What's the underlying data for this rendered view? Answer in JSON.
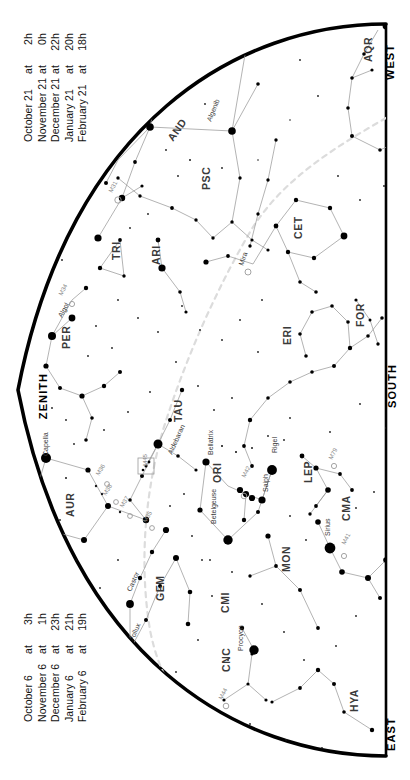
{
  "meta": {
    "orientation": "rotated-90",
    "background": "#ffffff",
    "ink": "#000000",
    "ecliptic_color": "#d8d8d8"
  },
  "cardinals": {
    "west": "WEST",
    "south": "SOUTH",
    "east": "EAST",
    "zenith": "ZENITH"
  },
  "legend_top": {
    "rows": [
      {
        "date": "October 21",
        "at": "at",
        "time": "2h"
      },
      {
        "date": "November 21",
        "at": "at",
        "time": "0h"
      },
      {
        "date": "December 21",
        "at": "at",
        "time": "22h"
      },
      {
        "date": "January 21",
        "at": "at",
        "time": "20h"
      },
      {
        "date": "February 21",
        "at": "at",
        "time": "18h"
      }
    ]
  },
  "legend_bottom": {
    "rows": [
      {
        "date": "October 6",
        "at": "at",
        "time": "3h"
      },
      {
        "date": "November 6",
        "at": "at",
        "time": "1h"
      },
      {
        "date": "December 6",
        "at": "at",
        "time": "23h"
      },
      {
        "date": "January 6",
        "at": "at",
        "time": "21h"
      },
      {
        "date": "February 6",
        "at": "at",
        "time": "19h"
      }
    ]
  },
  "chart_data": {
    "type": "scatter",
    "projection": "half-dome horizon map",
    "grid": false,
    "legend_position": "left",
    "constellations": [
      {
        "abbr": "AQR",
        "x": 372,
        "y": 62,
        "rot": -90
      },
      {
        "abbr": "PEG",
        "x": 205,
        "y": 76,
        "rot": -58
      },
      {
        "abbr": "AND",
        "x": 173,
        "y": 142,
        "rot": -55
      },
      {
        "abbr": "PSC",
        "x": 210,
        "y": 190,
        "rot": -90
      },
      {
        "abbr": "CET",
        "x": 302,
        "y": 239,
        "rot": -90
      },
      {
        "abbr": "TRI",
        "x": 120,
        "y": 260,
        "rot": -90
      },
      {
        "abbr": "ARI",
        "x": 160,
        "y": 265,
        "rot": -90
      },
      {
        "abbr": "PER",
        "x": 70,
        "y": 349,
        "rot": -90
      },
      {
        "abbr": "ERI",
        "x": 291,
        "y": 345,
        "rot": -90
      },
      {
        "abbr": "FOR",
        "x": 364,
        "y": 327,
        "rot": -90
      },
      {
        "abbr": "TAU",
        "x": 182,
        "y": 422,
        "rot": -90
      },
      {
        "abbr": "AUR",
        "x": 74,
        "y": 517,
        "rot": -90
      },
      {
        "abbr": "ORI",
        "x": 221,
        "y": 483,
        "rot": -90
      },
      {
        "abbr": "LEP",
        "x": 312,
        "y": 483,
        "rot": -90
      },
      {
        "abbr": "CMA",
        "x": 350,
        "y": 521,
        "rot": -90
      },
      {
        "abbr": "GEM",
        "x": 164,
        "y": 601,
        "rot": -90
      },
      {
        "abbr": "CMI",
        "x": 229,
        "y": 613,
        "rot": -90
      },
      {
        "abbr": "MON",
        "x": 290,
        "y": 572,
        "rot": -90
      },
      {
        "abbr": "CNC",
        "x": 230,
        "y": 672,
        "rot": -90
      },
      {
        "abbr": "HYA",
        "x": 358,
        "y": 712,
        "rot": -90
      }
    ],
    "named_stars": [
      {
        "name": "Algenib",
        "x": 211,
        "y": 122,
        "rot": -68,
        "mag": 2.8
      },
      {
        "name": "Alpheratz",
        "x": 150,
        "y": 117,
        "rot": -58,
        "mag": 2.1
      },
      {
        "name": "Mira",
        "x": 243,
        "y": 266,
        "rot": -70,
        "mag": 3.5
      },
      {
        "name": "Algol",
        "x": 62,
        "y": 318,
        "rot": -62,
        "mag": 2.1
      },
      {
        "name": "Capella",
        "x": 48,
        "y": 456,
        "rot": -90,
        "mag": 0.1
      },
      {
        "name": "Aldebaran",
        "x": 172,
        "y": 455,
        "rot": -66,
        "mag": 0.9
      },
      {
        "name": "Bellatrix",
        "x": 213,
        "y": 455,
        "rot": -90,
        "mag": 1.6
      },
      {
        "name": "Betelgeuse",
        "x": 216,
        "y": 524,
        "rot": -90,
        "mag": 0.5
      },
      {
        "name": "Rigel",
        "x": 277,
        "y": 453,
        "rot": -90,
        "mag": 0.1
      },
      {
        "name": "Saiph",
        "x": 268,
        "y": 492,
        "rot": -90,
        "mag": 2.1
      },
      {
        "name": "Sirius",
        "x": 330,
        "y": 536,
        "rot": -90,
        "mag": -1.5
      },
      {
        "name": "Castor",
        "x": 131,
        "y": 592,
        "rot": -66,
        "mag": 1.6
      },
      {
        "name": "Pollux",
        "x": 133,
        "y": 642,
        "rot": -66,
        "mag": 1.1
      },
      {
        "name": "Procyon",
        "x": 243,
        "y": 651,
        "rot": -90,
        "mag": 0.4
      }
    ],
    "deep_sky_objects": [
      {
        "name": "M31",
        "x": 112,
        "y": 193,
        "rot": -62
      },
      {
        "name": "M34",
        "x": 62,
        "y": 296,
        "rot": -62
      },
      {
        "name": "M36",
        "x": 99,
        "y": 476,
        "rot": -58
      },
      {
        "name": "M38",
        "x": 106,
        "y": 496,
        "rot": -58
      },
      {
        "name": "M37",
        "x": 123,
        "y": 508,
        "rot": -58
      },
      {
        "name": "M35",
        "x": 146,
        "y": 523,
        "rot": -58
      },
      {
        "name": "M45",
        "x": 147,
        "y": 466,
        "rot": -90
      },
      {
        "name": "M42",
        "x": 245,
        "y": 478,
        "rot": -62
      },
      {
        "name": "M79",
        "x": 332,
        "y": 460,
        "rot": -62
      },
      {
        "name": "M41",
        "x": 345,
        "y": 545,
        "rot": -62
      },
      {
        "name": "M44",
        "x": 222,
        "y": 700,
        "rot": -62
      }
    ],
    "ecliptic": {
      "label": "ecliptic",
      "style": "dashed",
      "color": "#dcdcdc"
    },
    "magnitude_scale": [
      {
        "mag": "-1",
        "radius_px": 5.5
      },
      {
        "mag": "0",
        "radius_px": 4.8
      },
      {
        "mag": "1",
        "radius_px": 4.0
      },
      {
        "mag": "2",
        "radius_px": 3.2
      },
      {
        "mag": "3",
        "radius_px": 2.4
      },
      {
        "mag": "4",
        "radius_px": 1.7
      },
      {
        "mag": "5",
        "radius_px": 1.1
      }
    ]
  }
}
